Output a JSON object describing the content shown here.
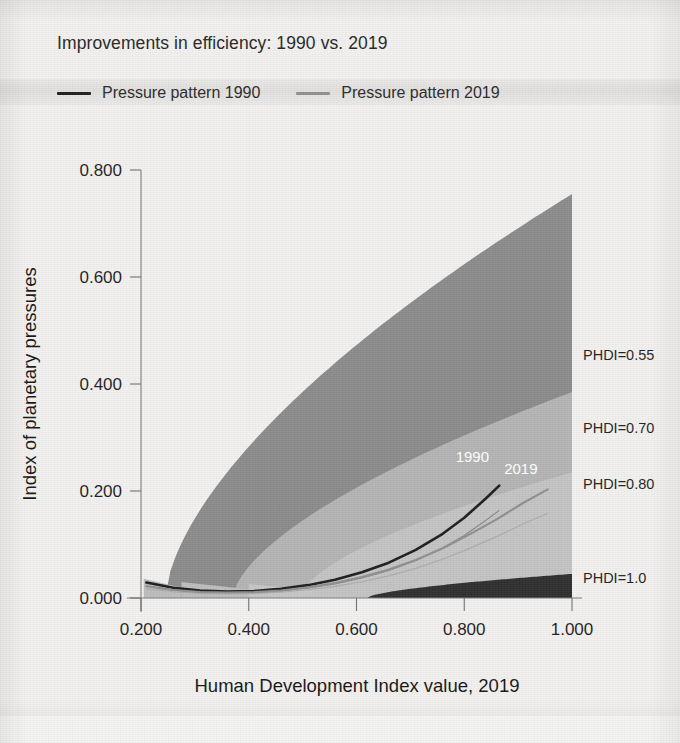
{
  "header": {
    "title": "Improvements in efficiency: 1990 vs. 2019"
  },
  "legend": {
    "items": [
      {
        "label": "Pressure pattern 1990",
        "color": "#1d1d1d",
        "swatch": "dark"
      },
      {
        "label": "Pressure pattern 2019",
        "color": "#8f8f8f",
        "swatch": "mid"
      }
    ]
  },
  "chart_data": {
    "type": "line",
    "title": "Improvements in efficiency: 1990 vs. 2019",
    "xlabel": "Human Development Index value, 2019",
    "ylabel": "Index of planetary pressures",
    "xlim": [
      0.2,
      1.0
    ],
    "ylim": [
      0.0,
      0.8
    ],
    "xticks": [
      "0.200",
      "0.400",
      "0.600",
      "0.800",
      "1.000"
    ],
    "xtick_values": [
      0.2,
      0.4,
      0.6,
      0.8,
      1.0
    ],
    "yticks": [
      "0.000",
      "0.200",
      "0.400",
      "0.600",
      "0.800"
    ],
    "ytick_values": [
      0.0,
      0.2,
      0.4,
      0.6,
      0.8
    ],
    "grid": false,
    "legend_position": "top",
    "series": [
      {
        "name": "Pressure pattern 1990",
        "color": "#1d1d1d",
        "inline_label": "1990",
        "x": [
          0.21,
          0.26,
          0.31,
          0.36,
          0.41,
          0.46,
          0.51,
          0.56,
          0.61,
          0.66,
          0.71,
          0.76,
          0.8,
          0.84,
          0.865
        ],
        "y": [
          0.029,
          0.019,
          0.014,
          0.012,
          0.013,
          0.017,
          0.024,
          0.034,
          0.048,
          0.066,
          0.09,
          0.12,
          0.15,
          0.186,
          0.21
        ]
      },
      {
        "name": "Pressure pattern 2019",
        "color": "#8f8f8f",
        "inline_label": "2019",
        "x": [
          0.21,
          0.26,
          0.31,
          0.36,
          0.41,
          0.46,
          0.51,
          0.56,
          0.61,
          0.66,
          0.71,
          0.76,
          0.81,
          0.86,
          0.91,
          0.955
        ],
        "y": [
          0.022,
          0.015,
          0.011,
          0.01,
          0.011,
          0.014,
          0.02,
          0.028,
          0.039,
          0.053,
          0.071,
          0.093,
          0.119,
          0.147,
          0.178,
          0.203
        ]
      }
    ],
    "bands": [
      {
        "name": "PHDI=0.55",
        "label": "PHDI=0.55",
        "color": "#8b8b8b",
        "y_at_x_max": 0.755,
        "label_y": 0.455
      },
      {
        "name": "PHDI=0.70",
        "label": "PHDI=0.70",
        "color": "#b4b4b4",
        "y_at_x_max": 0.385,
        "label_y": 0.318
      },
      {
        "name": "PHDI=0.80",
        "label": "PHDI=0.80",
        "color": "#c3c3c3",
        "y_at_x_max": 0.235,
        "label_y": 0.213
      },
      {
        "name": "PHDI=1.0",
        "label": "PHDI=1.0",
        "color": "#2e2e2e",
        "y_at_x_max": 0.045,
        "label_y": 0.038
      }
    ],
    "annotations": [
      {
        "text": "1990",
        "x": 0.815,
        "y": 0.255,
        "color": "#ffffff"
      },
      {
        "text": "2019",
        "x": 0.905,
        "y": 0.232,
        "color": "#ffffff"
      }
    ]
  }
}
